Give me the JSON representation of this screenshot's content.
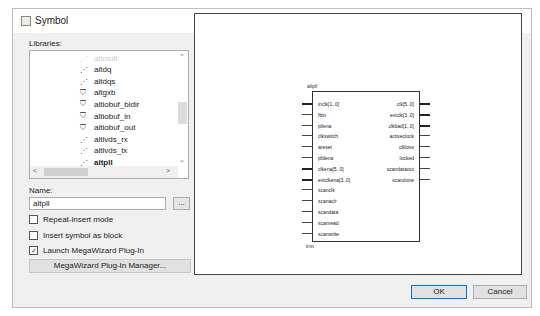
{
  "dialog": {
    "title": "Symbol",
    "close_icon": "close-icon"
  },
  "libraries": {
    "label": "Libraries:",
    "items": [
      {
        "name": "altmult",
        "icon": "wand-icon",
        "faded": true
      },
      {
        "name": "altdq",
        "icon": "wand-icon"
      },
      {
        "name": "altdqs",
        "icon": "wand-icon"
      },
      {
        "name": "altgxb",
        "icon": "chip-icon"
      },
      {
        "name": "altiobuf_bidir",
        "icon": "chip-icon"
      },
      {
        "name": "altiobuf_in",
        "icon": "chip-icon"
      },
      {
        "name": "altiobuf_out",
        "icon": "chip-icon"
      },
      {
        "name": "altlvds_rx",
        "icon": "wand-icon"
      },
      {
        "name": "altlvds_tx",
        "icon": "wand-icon"
      },
      {
        "name": "altpll",
        "icon": "wand-icon",
        "selected": true
      }
    ]
  },
  "name": {
    "label": "Name:",
    "value": "altpll",
    "browse_label": "..."
  },
  "options": {
    "repeat_insert": {
      "label": "Repeat-insert mode",
      "checked": false
    },
    "insert_as_block": {
      "label": "Insert symbol as block",
      "checked": false
    },
    "launch_megawizard": {
      "label": "Launch MegaWizard Plug-In",
      "checked": true
    }
  },
  "megawizard_button": "MegaWizard Plug-In Manager...",
  "symbol": {
    "name": "altpll",
    "instance": "inst",
    "inputs": [
      "inclk[1..0]",
      "fbin",
      "pllena",
      "clkswitch",
      "areset",
      "pfdena",
      "clkena[5..0]",
      "extclkena[3..0]",
      "scanclk",
      "scanaclr",
      "scandata",
      "scanread",
      "scanwrite"
    ],
    "input_bus": [
      true,
      false,
      false,
      false,
      false,
      false,
      true,
      true,
      false,
      false,
      false,
      false,
      false
    ],
    "outputs": [
      "clk[5..0]",
      "extclk[3..0]",
      "clkbad[1..0]",
      "activeclock",
      "clkloss",
      "locked",
      "scandataout",
      "scandone"
    ],
    "output_bus": [
      true,
      true,
      true,
      false,
      false,
      false,
      false,
      false
    ]
  },
  "buttons": {
    "ok": "OK",
    "cancel": "Cancel"
  }
}
